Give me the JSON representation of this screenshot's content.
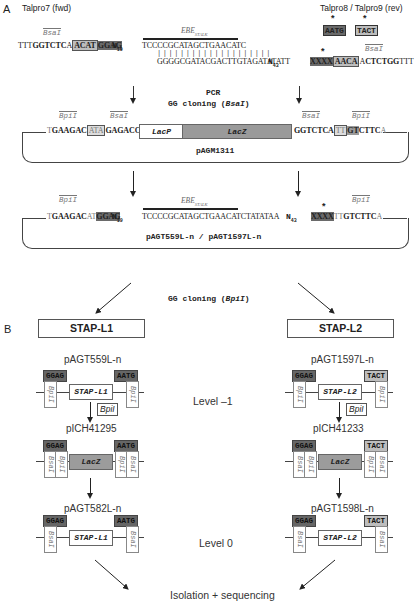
{
  "panels": {
    "a": "A",
    "b": "B"
  },
  "primers": {
    "fwd": "Talpro7 (fwd)",
    "rev": "Talpro8 / Talpro9 (rev)",
    "rev_overhangs": [
      "AATG",
      "TACT"
    ],
    "star": "*"
  },
  "enzymes": {
    "bsai": "BsaI",
    "bpii": "BpiI",
    "bpii_box": "BpiI"
  },
  "sequence_top": {
    "fwd_prefix": "TTT",
    "fwd_bsai": "GGTCTC",
    "fwd_a": "A",
    "fwd_boxed": "ACAT",
    "fwd_ggag": "GGAG",
    "n19": "N",
    "n19_sub": "19",
    "ebe_label": "EBE",
    "ebe_sub": "STALK",
    "ebe_top": "TCCCCGCATAGCTGAACATC",
    "ticks": "||||||||||||||||||||",
    "ebe_bottom": "GGGGCGATACGACTTGTAGATATATT",
    "n43": "N",
    "n43_sub": "43",
    "rev_xxxx": "XXXX",
    "rev_aaca": "AACA",
    "rev_a": "A",
    "rev_bsai": "CTCTGG",
    "rev_suffix": "TTT"
  },
  "step1": {
    "line1": "PCR",
    "line2_pre": "GG cloning (",
    "line2_enz": "BsaI",
    "line2_post": ")"
  },
  "pagm1311": {
    "name": "pAGM1311",
    "left_t": "T",
    "left_bpii": "GAAGAC",
    "left_boxed": "ATA",
    "left_bsai": "GAGACC",
    "lacp": "LacP",
    "lacz": "LacZ",
    "right_bsai": "GGTCTCA",
    "right_boxed": "TT",
    "right_gt": "GT",
    "right_bpii": "CTTC",
    "right_a": "A"
  },
  "pagt_product": {
    "name": "pAGT559L-n / pAGT1597L-n",
    "left_t": "T",
    "left_bpii": "GAAGAC",
    "left_at": "AT",
    "left_ggag": "GGAG",
    "n19": "N",
    "n19_sub": "19",
    "ebe_label": "EBE",
    "ebe_sub": "STALK",
    "seq": "TCCCCGCATAGCTGAACATCTATATAA",
    "n43": "N",
    "n43_sub": "43",
    "xxxx": "XXXX",
    "tt": "TT",
    "right_bpii": "GTCTTC",
    "right_a": "A"
  },
  "step2": {
    "pre": "GG cloning (",
    "enz": "BpiI",
    "post": ")"
  },
  "section_b": {
    "left_title": "STAP-L1",
    "right_title": "STAP-L2",
    "level_minus1": "Level –1",
    "level_0": "Level 0",
    "final": "Isolation + sequencing",
    "left": {
      "p1": "pAGT559L-n",
      "p2": "pICH41295",
      "p3": "pAGT582L-n",
      "oh_left": "GGAG",
      "oh_right": "AATG",
      "gene": "STAP-L1",
      "lacz": "LacZ",
      "bpii_box": "BpiI"
    },
    "right": {
      "p1": "pAGT1597L-n",
      "p2": "pICH41233",
      "p3": "pAGT1598L-n",
      "oh_left": "GGAG",
      "oh_right": "TACT",
      "gene": "STAP-L2",
      "lacz": "LacZ",
      "bpii_box": "BpiI"
    },
    "site_bpii": "BpiI",
    "site_bsai": "BsaI"
  }
}
